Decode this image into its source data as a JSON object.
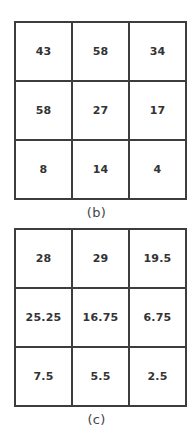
{
  "figures": [
    {
      "id": "b",
      "caption": "(b)",
      "rows": [
        [
          "43",
          "58",
          "34"
        ],
        [
          "58",
          "27",
          "17"
        ],
        [
          "8",
          "14",
          "4"
        ]
      ]
    },
    {
      "id": "c",
      "caption": "(c)",
      "rows": [
        [
          "28",
          "29",
          "19.5"
        ],
        [
          "25.25",
          "16.75",
          "6.75"
        ],
        [
          "7.5",
          "5.5",
          "2.5"
        ]
      ]
    }
  ],
  "colors": {
    "border": "#3d3d3d",
    "cell_background": "#ffffff",
    "text": "#333333",
    "caption_text": "#444444",
    "page_background": "#ffffff"
  },
  "chart_data": [
    {
      "type": "table",
      "title": "(b)",
      "rows": 3,
      "columns": 3,
      "values": [
        [
          43,
          58,
          34
        ],
        [
          58,
          27,
          17
        ],
        [
          8,
          14,
          4
        ]
      ],
      "grid": true,
      "xlabel": "",
      "ylabel": ""
    },
    {
      "type": "table",
      "title": "(c)",
      "rows": 3,
      "columns": 3,
      "values": [
        [
          28,
          29,
          19.5
        ],
        [
          25.25,
          16.75,
          6.75
        ],
        [
          7.5,
          5.5,
          2.5
        ]
      ],
      "grid": true,
      "xlabel": "",
      "ylabel": ""
    }
  ]
}
